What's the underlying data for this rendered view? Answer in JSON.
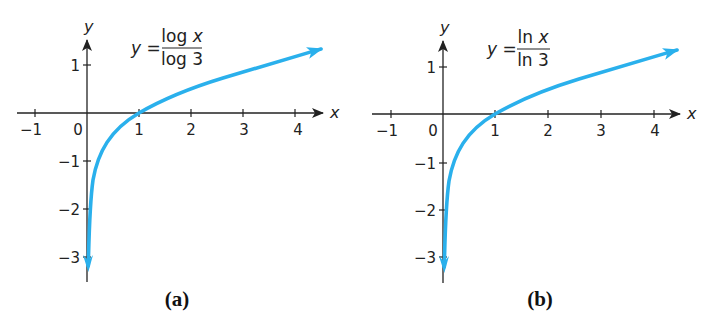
{
  "chart_data": [
    {
      "type": "line",
      "panel": "a",
      "caption": "(a)",
      "title": "",
      "equation": {
        "lhs": "y =",
        "numerator": "log x",
        "denominator": "log 3"
      },
      "xlabel": "x",
      "ylabel": "y",
      "x_ticks": [
        -1,
        1,
        2,
        3,
        4
      ],
      "x_tick_labels": [
        "−1",
        "1",
        "2",
        "3",
        "4"
      ],
      "origin_label": "0",
      "y_ticks": [
        1,
        -1,
        -2,
        -3
      ],
      "y_tick_labels": [
        "1",
        "−1",
        "−2",
        "−3"
      ],
      "xlim": [
        -1.3,
        4.6
      ],
      "ylim": [
        -3.4,
        1.5
      ],
      "grid": false,
      "series": [
        {
          "name": "y = log x / log 3",
          "color": "#2ab0ec",
          "x": [
            0.02,
            0.05,
            0.1,
            0.2,
            0.3333,
            0.5,
            0.75,
            1,
            1.5,
            2,
            2.5,
            3,
            3.5,
            4,
            4.5
          ],
          "y": [
            -3.56,
            -2.73,
            -2.1,
            -1.46,
            -1.0,
            -0.63,
            -0.26,
            0,
            0.37,
            0.63,
            0.83,
            1.0,
            1.14,
            1.26,
            1.37
          ]
        }
      ]
    },
    {
      "type": "line",
      "panel": "b",
      "caption": "(b)",
      "title": "",
      "equation": {
        "lhs": "y =",
        "numerator": "ln x",
        "denominator": "ln 3"
      },
      "xlabel": "x",
      "ylabel": "y",
      "x_ticks": [
        -1,
        1,
        2,
        3,
        4
      ],
      "x_tick_labels": [
        "−1",
        "1",
        "2",
        "3",
        "4"
      ],
      "origin_label": "0",
      "y_ticks": [
        1,
        -1,
        -2,
        -3
      ],
      "y_tick_labels": [
        "1",
        "−1",
        "−2",
        "−3"
      ],
      "xlim": [
        -1.3,
        4.6
      ],
      "ylim": [
        -3.4,
        1.5
      ],
      "grid": false,
      "series": [
        {
          "name": "y = ln x / ln 3",
          "color": "#2ab0ec",
          "x": [
            0.02,
            0.05,
            0.1,
            0.2,
            0.3333,
            0.5,
            0.75,
            1,
            1.5,
            2,
            2.5,
            3,
            3.5,
            4,
            4.5
          ],
          "y": [
            -3.56,
            -2.73,
            -2.1,
            -1.46,
            -1.0,
            -0.63,
            -0.26,
            0,
            0.37,
            0.63,
            0.83,
            1.0,
            1.14,
            1.26,
            1.37
          ]
        }
      ]
    }
  ],
  "colors": {
    "curve": "#2ab0ec",
    "axis": "#222222"
  }
}
